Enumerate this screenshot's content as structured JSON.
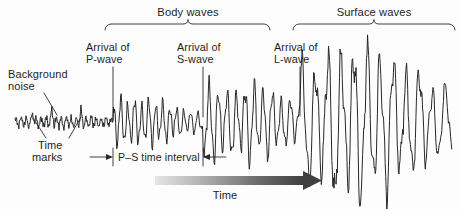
{
  "figure": {
    "type": "seismogram-diagram",
    "background_color": "#fdfdfd",
    "ink_color": "#1d1d1d",
    "width": 461,
    "height": 209
  },
  "groups": {
    "body_waves": {
      "label": "Body waves",
      "bracket_x_start": 105,
      "bracket_x_end": 270,
      "bracket_notch_x": 188,
      "bracket_y": 24
    },
    "surface_waves": {
      "label": "Surface waves",
      "bracket_x_start": 293,
      "bracket_x_end": 455,
      "bracket_notch_x": 374,
      "bracket_y": 24
    }
  },
  "arrivals": [
    {
      "label_line1": "Arrival of",
      "label_line2": "P-wave",
      "marker_x": 113,
      "marker_y_top": 67,
      "marker_y_bottom": 122
    },
    {
      "label_line1": "Arrival of",
      "label_line2": "S-wave",
      "marker_x": 203,
      "marker_y_top": 67,
      "marker_y_bottom": 122
    },
    {
      "label_line1": "Arrival of",
      "label_line2": "L-wave",
      "marker_x": 300,
      "marker_y_top": 67,
      "marker_y_bottom": 122
    }
  ],
  "annotations": {
    "background_noise": {
      "line1": "Background",
      "line2": "noise"
    },
    "time_marks": {
      "line1": "Time",
      "line2": "marks"
    },
    "ps_interval": {
      "label": "P–S time interval",
      "left_tick_x": 113,
      "right_tick_x": 203,
      "y": 157
    }
  },
  "time_axis": {
    "label": "Time",
    "arrow_x_start": 155,
    "arrow_x_end": 320,
    "arrow_y": 180,
    "gradient_start_color": "#e3e3e3",
    "gradient_end_color": "#4a4a4a"
  },
  "chart_data": {
    "type": "line",
    "xlabel": "Time",
    "ylabel": "",
    "grid": false,
    "legend": "none",
    "baseline_y": 122,
    "x_range": [
      15,
      452
    ],
    "series": [
      {
        "name": "seismic trace",
        "color": "#1d1d1d",
        "segments": [
          {
            "name": "background noise",
            "x_start": 15,
            "x_end": 113,
            "amplitude": 5,
            "period": 5.0,
            "description": "low-amplitude microseismic background with time marks"
          },
          {
            "name": "P-wave coda",
            "x_start": 113,
            "x_end": 203,
            "amplitude": 17,
            "period": 7.0,
            "description": "moderate amplitude compressional arrivals decaying between bursts"
          },
          {
            "name": "S-wave coda",
            "x_start": 203,
            "x_end": 300,
            "amplitude": 27,
            "period": 9.0,
            "description": "larger shear-wave oscillations"
          },
          {
            "name": "L-wave surface train",
            "x_start": 300,
            "x_end": 452,
            "amplitude": 34,
            "period": 13.0,
            "description": "largest long-period surface waves tapering at the end"
          }
        ]
      }
    ],
    "annotations": [
      {
        "text": "Background noise",
        "x": 55
      },
      {
        "text": "Time marks",
        "x": 62
      },
      {
        "text": "Arrival of P-wave",
        "x": 113
      },
      {
        "text": "Arrival of S-wave",
        "x": 203
      },
      {
        "text": "Arrival of L-wave",
        "x": 300
      },
      {
        "text": "P–S time interval",
        "x": 158
      },
      {
        "text": "Body waves",
        "x": 188
      },
      {
        "text": "Surface waves",
        "x": 374
      }
    ]
  }
}
